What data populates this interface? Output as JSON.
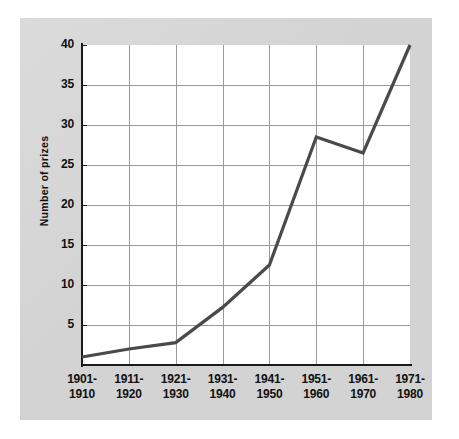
{
  "chart_data": {
    "type": "line",
    "title": "",
    "xlabel": "",
    "ylabel": "Number of prizes",
    "categories": [
      "1901-\n1910",
      "1911-\n1920",
      "1921-\n1930",
      "1931-\n1940",
      "1941-\n1950",
      "1951-\n1960",
      "1961-\n1970",
      "1971-\n1980"
    ],
    "category_lines": [
      [
        "1901-",
        "1910"
      ],
      [
        "1911-",
        "1920"
      ],
      [
        "1921-",
        "1930"
      ],
      [
        "1931-",
        "1940"
      ],
      [
        "1941-",
        "1950"
      ],
      [
        "1951-",
        "1960"
      ],
      [
        "1961-",
        "1970"
      ],
      [
        "1971-",
        "1980"
      ]
    ],
    "values": [
      1,
      2,
      2.8,
      7.2,
      12.5,
      28.5,
      26.5,
      40
    ],
    "ylim": [
      0,
      40
    ],
    "ytick_labels": [
      "40",
      "35",
      "30",
      "25",
      "20",
      "15",
      "10",
      "5"
    ],
    "ytick_values": [
      40,
      35,
      30,
      25,
      20,
      15,
      10,
      5
    ],
    "grid": true,
    "legend": "none",
    "series_color": "#4a4a4a",
    "grid_color": "#9a9a9a",
    "axis_color": "#1a1a1a",
    "plot_bg": "#ffffff",
    "panel_bg": "#d3d3d3"
  }
}
